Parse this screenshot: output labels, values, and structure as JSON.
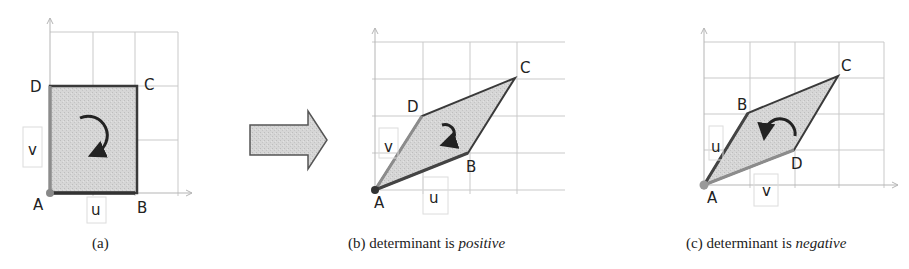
{
  "colors": {
    "fill": "#d3d3d3",
    "edge_dark": "#3a3a3a",
    "edge_u": "#444444",
    "edge_v": "#8c8c8c",
    "grid": "#c9c9c9",
    "arrow_fill": "#a9a9a9"
  },
  "panels": [
    {
      "id": "a",
      "caption": "(a)",
      "caption_italic": "",
      "vertices": {
        "A": "A",
        "B": "B",
        "C": "C",
        "D": "D"
      },
      "vector_labels": {
        "u": "u",
        "v": "v"
      },
      "rotation": "clockwise"
    },
    {
      "id": "b",
      "caption": "(b) determinant is ",
      "caption_italic": "positive",
      "vertices": {
        "A": "A",
        "B": "B",
        "C": "C",
        "D": "D"
      },
      "vector_labels": {
        "u": "u",
        "v": "v"
      },
      "rotation": "clockwise"
    },
    {
      "id": "c",
      "caption": "(c) determinant is ",
      "caption_italic": "negative",
      "vertices": {
        "A": "A",
        "B": "B",
        "C": "C",
        "D": "D"
      },
      "vector_labels": {
        "u": "u",
        "v": "v"
      },
      "rotation": "counterclockwise"
    }
  ],
  "transition_arrow": "right-arrow"
}
